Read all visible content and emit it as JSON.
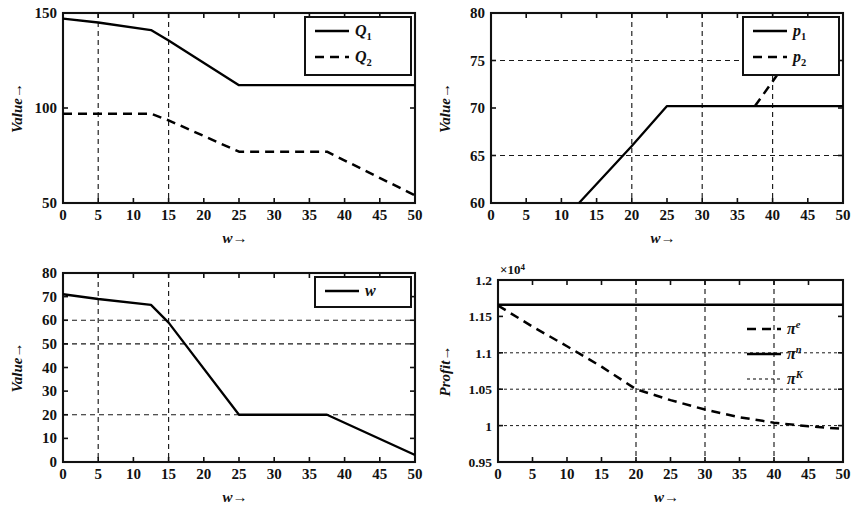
{
  "figure": {
    "background": "#ffffff",
    "line_color": "#000000",
    "panel_count": 4
  },
  "chart_data": [
    {
      "id": "panel-top-left",
      "type": "line",
      "title": "",
      "xlabel": "w→",
      "ylabel": "Value→",
      "xlim": [
        0,
        50
      ],
      "ylim": [
        50,
        150
      ],
      "xticks": [
        0,
        5,
        10,
        15,
        20,
        25,
        30,
        35,
        40,
        45,
        50
      ],
      "xticklabels": [
        "0",
        "5",
        "10",
        "15",
        "20",
        "25",
        "30",
        "35",
        "40",
        "45",
        "50"
      ],
      "yticks": [
        50,
        100,
        150
      ],
      "yticklabels": [
        "50",
        "100",
        "150"
      ],
      "grid": true,
      "grid_x": [
        5,
        15
      ],
      "grid_y": [],
      "legend_position": "top-right",
      "series": [
        {
          "name": "Q₁",
          "base": "Q",
          "sub": "1",
          "style": "solid",
          "x": [
            0,
            5,
            12.5,
            15,
            25,
            37.5,
            50
          ],
          "values": [
            147,
            145,
            141,
            135.5,
            112,
            112,
            112
          ]
        },
        {
          "name": "Q₂",
          "base": "Q",
          "sub": "2",
          "style": "dashed",
          "x": [
            0,
            5,
            12.5,
            15,
            25,
            37.5,
            50
          ],
          "values": [
            97,
            97,
            97,
            93.5,
            77,
            77,
            54
          ]
        }
      ]
    },
    {
      "id": "panel-top-right",
      "type": "line",
      "title": "",
      "xlabel": "w→",
      "ylabel": "Value→",
      "xlim": [
        0,
        50
      ],
      "ylim": [
        60,
        80
      ],
      "xticks": [
        0,
        5,
        10,
        15,
        20,
        25,
        30,
        35,
        40,
        45,
        50
      ],
      "xticklabels": [
        "0",
        "5",
        "10",
        "15",
        "20",
        "25",
        "30",
        "35",
        "40",
        "45",
        "50"
      ],
      "yticks": [
        60,
        65,
        70,
        75,
        80
      ],
      "yticklabels": [
        "60",
        "65",
        "70",
        "75",
        "80"
      ],
      "grid": true,
      "grid_x": [
        20,
        30,
        40
      ],
      "grid_y": [
        65,
        75
      ],
      "legend_position": "top-right",
      "series": [
        {
          "name": "p₁",
          "base": "p",
          "sub": "1",
          "style": "solid",
          "x": [
            12.5,
            20,
            25,
            30,
            40,
            50
          ],
          "values": [
            60,
            66,
            70.2,
            70.2,
            70.2,
            70.2
          ]
        },
        {
          "name": "p₂",
          "base": "p",
          "sub": "2",
          "style": "dashed",
          "x": [
            37.5,
            40,
            42.5
          ],
          "values": [
            70.2,
            72.8,
            75.4
          ]
        }
      ]
    },
    {
      "id": "panel-bottom-left",
      "type": "line",
      "title": "",
      "xlabel": "w→",
      "ylabel": "Value→",
      "xlim": [
        0,
        50
      ],
      "ylim": [
        0,
        80
      ],
      "xticks": [
        0,
        5,
        10,
        15,
        20,
        25,
        30,
        35,
        40,
        45,
        50
      ],
      "xticklabels": [
        "0",
        "5",
        "10",
        "15",
        "20",
        "25",
        "30",
        "35",
        "40",
        "45",
        "50"
      ],
      "yticks": [
        0,
        10,
        20,
        30,
        40,
        50,
        60,
        70,
        80
      ],
      "yticklabels": [
        "0",
        "10",
        "20",
        "30",
        "40",
        "50",
        "60",
        "70",
        "80"
      ],
      "grid": true,
      "grid_x": [
        5,
        15
      ],
      "grid_y": [
        20,
        50,
        60
      ],
      "legend_position": "top-right",
      "series": [
        {
          "name": "w",
          "base": "w",
          "sub": "",
          "style": "solid",
          "x": [
            0,
            5,
            12.5,
            15,
            25,
            37.5,
            50
          ],
          "values": [
            71,
            69,
            66.5,
            59,
            20,
            20,
            3
          ]
        }
      ]
    },
    {
      "id": "panel-bottom-right",
      "type": "line",
      "title": "",
      "xlabel": "w→",
      "ylabel": "Profit→",
      "y_exponent": "×10",
      "y_exponent_power": "4",
      "xlim": [
        0,
        50
      ],
      "ylim": [
        9500,
        12000
      ],
      "xticks": [
        0,
        5,
        10,
        15,
        20,
        25,
        30,
        35,
        40,
        45,
        50
      ],
      "xticklabels": [
        "0",
        "5",
        "10",
        "15",
        "20",
        "25",
        "30",
        "35",
        "40",
        "45",
        "50"
      ],
      "yticks": [
        9500,
        10000,
        10500,
        11000,
        11500,
        12000
      ],
      "yticklabels": [
        "0.95",
        "1",
        "1.05",
        "1.1",
        "1.15",
        "1.2"
      ],
      "grid": true,
      "grid_x": [
        20,
        30,
        40
      ],
      "grid_y": [
        10000,
        10500,
        11000
      ],
      "legend_position": "right",
      "series": [
        {
          "name": "πᵉ",
          "base": "π",
          "sup": "e",
          "style": "dashed",
          "x": [
            0,
            5,
            10,
            15,
            20,
            25,
            30,
            35,
            40,
            45,
            50
          ],
          "values": [
            11650,
            11360,
            11090,
            10810,
            10500,
            10350,
            10220,
            10115,
            10040,
            9990,
            9955
          ]
        },
        {
          "name": "πⁿ",
          "base": "π",
          "sup": "n",
          "style": "solid",
          "x": [
            0,
            50
          ],
          "values": [
            11660,
            11660
          ]
        },
        {
          "name": "πᵏ",
          "base": "π",
          "sup": "K",
          "style": "dotted",
          "x": [],
          "values": []
        }
      ]
    }
  ]
}
